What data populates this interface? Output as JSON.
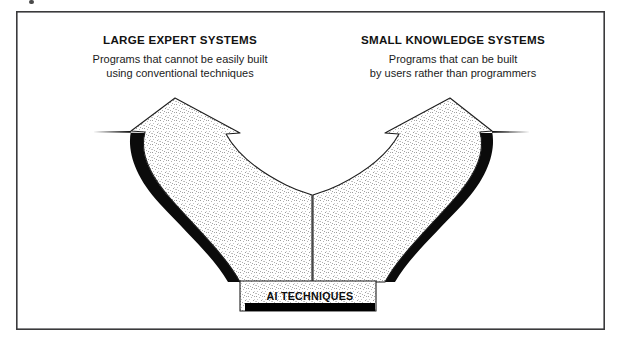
{
  "figure": {
    "kind": "forking-arrow-diagram",
    "caption_absent": true,
    "frame": {
      "x": 16,
      "y": 11,
      "width": 589,
      "height": 319,
      "stroke_color": "#3a3a3c"
    },
    "colors": {
      "outline": "#1d1d1d",
      "shadow": "#0b0b0b",
      "fill_texture": "#ffffff stipple on white",
      "text": "#121212",
      "trunk_bar": "#000000"
    }
  },
  "branches": [
    {
      "id": "left",
      "title": "LARGE EXPERT SYSTEMS",
      "subtitle_lines": [
        "Programs that cannot be easily built",
        "using conventional techniques"
      ],
      "title_center_x": 180,
      "title_y": 44,
      "subtitle_y": 63,
      "arrow_apex_x": 175,
      "arrow_apex_y": 98
    },
    {
      "id": "right",
      "title": "SMALL KNOWLEDGE SYSTEMS",
      "subtitle_lines": [
        "Programs that can be built",
        "by users rather than programmers"
      ],
      "title_center_x": 453,
      "title_y": 44,
      "subtitle_y": 63,
      "arrow_apex_x": 450,
      "arrow_apex_y": 98
    }
  ],
  "trunk": {
    "label": "AI TECHNIQUES",
    "label_center_x": 310,
    "label_y": 300,
    "bar_x": 245,
    "bar_y": 303,
    "bar_width": 130,
    "bar_height": 8
  }
}
